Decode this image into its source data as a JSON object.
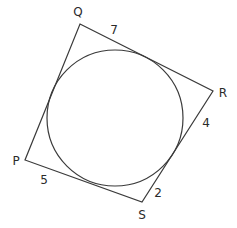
{
  "figure": {
    "type": "tangential quadrilateral with inscribed circle",
    "stroke_color": "#3a3a3a",
    "background": "#ffffff"
  },
  "vertices": [
    {
      "name": "Q",
      "x": 80,
      "y": 24,
      "label_x": 78,
      "label_y": 12
    },
    {
      "name": "R",
      "x": 213,
      "y": 91,
      "label_x": 222,
      "label_y": 93
    },
    {
      "name": "S",
      "x": 142,
      "y": 202,
      "label_x": 142,
      "label_y": 215
    },
    {
      "name": "P",
      "x": 25,
      "y": 160,
      "label_x": 16,
      "label_y": 161
    }
  ],
  "circle": {
    "cx": 115,
    "cy": 118,
    "r": 68
  },
  "segment_labels": [
    {
      "value": "7",
      "x": 114,
      "y": 30,
      "near": "Q on side QR"
    },
    {
      "value": "4",
      "x": 206,
      "y": 123,
      "near": "R on side RS"
    },
    {
      "value": "2",
      "x": 158,
      "y": 193,
      "near": "S on side RS"
    },
    {
      "value": "5",
      "x": 44,
      "y": 180,
      "near": "P on side PS"
    }
  ],
  "labels": {
    "Q": "Q",
    "R": "R",
    "S": "S",
    "P": "P",
    "seg_7": "7",
    "seg_4": "4",
    "seg_2": "2",
    "seg_5": "5"
  }
}
